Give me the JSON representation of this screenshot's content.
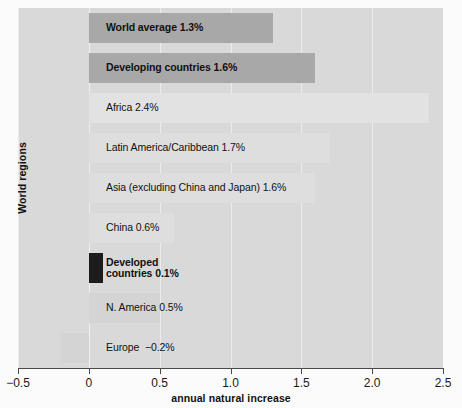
{
  "chart_data": {
    "type": "bar",
    "orientation": "horizontal",
    "title": "",
    "xlabel": "annual natural increase",
    "ylabel": "World regions",
    "xlim": [
      -0.5,
      2.5
    ],
    "xticks": [
      "-0.5",
      "0",
      "0.5",
      "1.0",
      "1.5",
      "2.0",
      "2.5"
    ],
    "xtick_values": [
      -0.5,
      0,
      0.5,
      1.0,
      1.5,
      2.0,
      2.5
    ],
    "grid": true,
    "legend": "none",
    "categories": [
      "World average",
      "Developing countries",
      "Africa",
      "Latin America/Caribbean",
      "Asia (excluding China and Japan)",
      "China",
      "Developed countries",
      "N. America",
      "Europe"
    ],
    "values": [
      1.3,
      1.6,
      2.4,
      1.7,
      1.6,
      0.6,
      0.1,
      0.5,
      -0.2
    ],
    "bars": [
      {
        "label": "World average 1.3%",
        "label_lines": [
          "World average 1.3%"
        ],
        "category": "World average",
        "value": 1.3,
        "value_text": "1.3%",
        "color": "#a8a8a8",
        "emphasis": "bold",
        "text_color": "#111111"
      },
      {
        "label": "Developing countries 1.6%",
        "label_lines": [
          "Developing countries 1.6%"
        ],
        "category": "Developing countries",
        "value": 1.6,
        "value_text": "1.6%",
        "color": "#a8a8a8",
        "emphasis": "bold",
        "text_color": "#111111"
      },
      {
        "label": "Africa 2.4%",
        "label_lines": [
          "Africa 2.4%"
        ],
        "category": "Africa",
        "value": 2.4,
        "value_text": "2.4%",
        "color": "#e2e2e2",
        "emphasis": "normal",
        "text_color": "#111111"
      },
      {
        "label": "Latin America/Caribbean 1.7%",
        "label_lines": [
          "Latin America/Caribbean 1.7%"
        ],
        "category": "Latin America/Caribbean",
        "value": 1.7,
        "value_text": "1.7%",
        "color": "#dedede",
        "emphasis": "normal",
        "text_color": "#111111"
      },
      {
        "label": "Asia (excluding China and Japan) 1.6%",
        "label_lines": [
          "Asia (excluding China and Japan) 1.6%"
        ],
        "category": "Asia (excluding China and Japan)",
        "value": 1.6,
        "value_text": "1.6%",
        "color": "#dedede",
        "emphasis": "normal",
        "text_color": "#111111"
      },
      {
        "label": "China 0.6%",
        "label_lines": [
          "China 0.6%"
        ],
        "category": "China",
        "value": 0.6,
        "value_text": "0.6%",
        "color": "#dedede",
        "emphasis": "normal",
        "text_color": "#111111"
      },
      {
        "label": "Developed countries 0.1%",
        "label_lines": [
          "Developed",
          "countries 0.1%"
        ],
        "category": "Developed countries",
        "value": 0.1,
        "value_text": "0.1%",
        "color": "#1c1c1c",
        "emphasis": "bold",
        "text_color": "#111111"
      },
      {
        "label": "N. America 0.5%",
        "label_lines": [
          "N. America 0.5%"
        ],
        "category": "N. America",
        "value": 0.5,
        "value_text": "0.5%",
        "color": "#d4d4d4",
        "emphasis": "normal",
        "text_color": "#111111"
      },
      {
        "label": "Europe  −0.2%",
        "label_lines": [
          "Europe  −0.2%"
        ],
        "category": "Europe",
        "value": -0.2,
        "value_text": "−0.2%",
        "color": "#d4d4d4",
        "emphasis": "normal",
        "text_color": "#111111"
      }
    ],
    "colors": {
      "panel_background": "#d9d9d9",
      "page_background": "#fbfbfb",
      "gridline": "#eeeeee",
      "axis": "#4a4a4a",
      "highlight_bar": "#a8a8a8",
      "dark_bar": "#1c1c1c",
      "light_bar": "#e2e2e2"
    }
  }
}
